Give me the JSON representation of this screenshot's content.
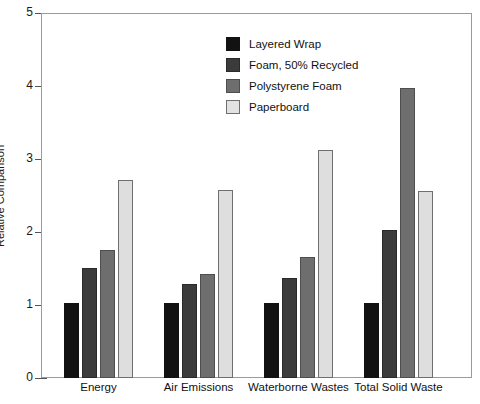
{
  "chart_data": {
    "type": "bar",
    "title": "",
    "xlabel": "",
    "ylabel": "Relative Comparison",
    "ylim": [
      0,
      5
    ],
    "yticks": [
      "0",
      "1",
      "2",
      "3",
      "4",
      "5"
    ],
    "grid": false,
    "legend_position": "upper-center",
    "categories": [
      "Energy",
      "Air Emissions",
      "Waterborne Wastes",
      "Total Solid Waste"
    ],
    "series": [
      {
        "name": "Layered Wrap",
        "color": "#121212",
        "values": [
          1.03,
          1.03,
          1.03,
          1.03
        ]
      },
      {
        "name": "Foam, 50% Recycled",
        "color": "#3b3b3b",
        "values": [
          1.51,
          1.29,
          1.37,
          2.03
        ]
      },
      {
        "name": "Polystyrene Foam",
        "color": "#6e6e6e",
        "values": [
          1.75,
          1.42,
          1.66,
          3.97
        ]
      },
      {
        "name": "Paperboard",
        "color": "#dedede",
        "values": [
          2.71,
          2.57,
          3.12,
          2.56
        ]
      }
    ]
  },
  "axis": {
    "y_label": "Relative Comparison",
    "y_ticks": [
      {
        "label": "5",
        "value": 5
      },
      {
        "label": "4",
        "value": 4
      },
      {
        "label": "3",
        "value": 3
      },
      {
        "label": "2",
        "value": 2
      },
      {
        "label": "1",
        "value": 1
      },
      {
        "label": "0",
        "value": 0
      }
    ]
  },
  "legend": {
    "items": [
      {
        "label": "Layered Wrap",
        "swatch": "s0"
      },
      {
        "label": "Foam, 50% Recycled",
        "swatch": "s1"
      },
      {
        "label": "Polystyrene Foam",
        "swatch": "s2"
      },
      {
        "label": "Paperboard",
        "swatch": "s3"
      }
    ]
  },
  "title_strip": {
    "text": ""
  }
}
